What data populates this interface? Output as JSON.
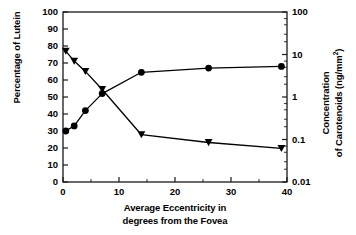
{
  "chart_data": {
    "type": "line",
    "title": "",
    "xlabel": "Average Eccentricity in degrees from the Fovea",
    "xlabel_lines": [
      "Average Eccentricity in",
      "degrees from the Fovea"
    ],
    "ylabel_left": "Percentage of Lutein",
    "ylabel_right": "Concentration of Carotenoids (ng/mm2)",
    "ylabel_right_lines": [
      "Concentration",
      "of Carotenoids (ng/mm"
    ],
    "ylabel_right_superscript": "2",
    "ylabel_right_tail": ")",
    "xlim": [
      0,
      40
    ],
    "xticks": [
      0,
      10,
      20,
      30,
      40
    ],
    "xticklabels": [
      "0",
      "10",
      "20",
      "30",
      "40"
    ],
    "xminorticks": [
      5,
      15,
      25,
      35
    ],
    "ylim_left": [
      0,
      100
    ],
    "yticks_left": [
      0,
      10,
      20,
      30,
      40,
      50,
      60,
      70,
      80,
      90,
      100
    ],
    "yticklabels_left": [
      "0",
      "10",
      "20",
      "30",
      "40",
      "50",
      "60",
      "70",
      "80",
      "90",
      "100"
    ],
    "ylim_right": [
      0.01,
      100
    ],
    "yscale_right": "log",
    "yticks_right": [
      0.01,
      0.1,
      1,
      10,
      100
    ],
    "yticklabels_right": [
      "0.01",
      "0.1",
      "1",
      "10",
      "100"
    ],
    "grid": false,
    "legend": "none",
    "series": [
      {
        "name": "Percentage of Lutein",
        "axis": "left",
        "marker": "circle",
        "color": "#000000",
        "x": [
          0.5,
          2,
          4,
          7,
          14,
          26,
          39
        ],
        "values": [
          30,
          33,
          42,
          52,
          64.5,
          67,
          68
        ]
      },
      {
        "name": "Concentration of Carotenoids",
        "axis": "right",
        "marker": "triangle-down",
        "color": "#000000",
        "x": [
          0.5,
          2,
          4,
          7,
          14,
          26,
          39
        ],
        "values": [
          12,
          7,
          4,
          1.5,
          0.13,
          0.085,
          0.062
        ]
      }
    ]
  }
}
